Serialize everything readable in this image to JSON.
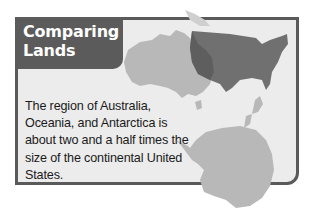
{
  "feature": {
    "title_line1": "Comparing",
    "title_line2": "Lands",
    "body": "The region of Australia, Oceania, and Antarctica is about two and a half times the size of the continental United States."
  },
  "map": {
    "regions": [
      "australia",
      "new-zealand",
      "antarctica",
      "continental-united-states"
    ],
    "colors": {
      "box_border": "#5a5a5a",
      "box_fill": "#ececec",
      "title_tab": "#5b5b5b",
      "southern_lands": "#b8b8b8",
      "united_states": "#6e6e6e",
      "overlap": "#5e5e5e"
    }
  }
}
